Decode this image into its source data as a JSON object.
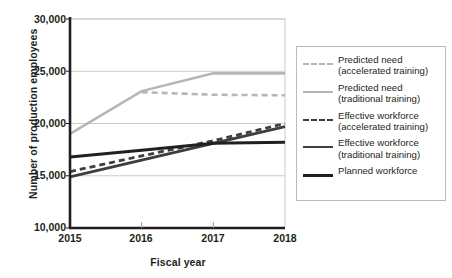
{
  "chart_data": {
    "type": "line",
    "title": "",
    "xlabel": "Fiscal year",
    "ylabel": "Number of production employees",
    "x": [
      2015,
      2016,
      2017,
      2018
    ],
    "xticklabels": [
      "2015",
      "2016",
      "2017",
      "2018"
    ],
    "yticklabels": [
      "10,000",
      "15,000",
      "20,000",
      "25,000",
      "30,000"
    ],
    "yticks": [
      10000,
      15000,
      20000,
      25000,
      30000
    ],
    "ylim": [
      10000,
      30000
    ],
    "xlim": [
      2015,
      2018
    ],
    "grid": "horizontal",
    "legend_position": "right-outside",
    "series": [
      {
        "name": "Predicted need\n(accelerated training)",
        "style": "dashed",
        "color": "#b4b6b8",
        "width": 2.6,
        "values": [
          null,
          23000,
          22750,
          22700
        ]
      },
      {
        "name": "Predicted need\n(traditional training)",
        "style": "solid",
        "color": "#b4b6b8",
        "width": 2.6,
        "values": [
          19000,
          23100,
          24800,
          24800
        ]
      },
      {
        "name": "Effective workforce\n(accelerated training)",
        "style": "dashed",
        "color": "#3e3e40",
        "width": 2.8,
        "values": [
          15400,
          16900,
          18350,
          20000
        ]
      },
      {
        "name": "Effective workforce\n(traditional training)",
        "style": "solid",
        "color": "#3e3e40",
        "width": 2.8,
        "values": [
          14900,
          16500,
          18100,
          19700
        ]
      },
      {
        "name": "Planned workforce",
        "style": "solid",
        "color": "#231f20",
        "width": 3.0,
        "values": [
          16800,
          17450,
          18100,
          18200
        ]
      }
    ]
  },
  "legend": {
    "items": [
      {
        "label": "Predicted need\n(accelerated training)",
        "swatch": "dashed-light-gray"
      },
      {
        "label": "Predicted need\n(traditional training)",
        "swatch": "solid-light-gray"
      },
      {
        "label": "Effective workforce\n(accelerated training)",
        "swatch": "dashed-dark-gray"
      },
      {
        "label": "Effective workforce\n(traditional training)",
        "swatch": "solid-dark-gray"
      },
      {
        "label": "Planned workforce",
        "swatch": "solid-black"
      }
    ]
  },
  "axes": {
    "x_title": "Fiscal year",
    "y_title": "Number of production employees"
  },
  "colors": {
    "light_gray": "#b4b6b8",
    "dark_gray": "#3e3e40",
    "black": "#231f20",
    "gridline": "#c9cccd",
    "legend_border": "#b9bcbe"
  }
}
